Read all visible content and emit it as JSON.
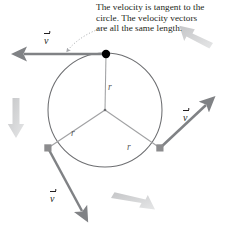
{
  "figure": {
    "caption": {
      "lines": [
        "The velocity is tangent to the",
        "circle. The velocity vectors",
        "are all the same length."
      ]
    },
    "circle": {
      "center_x": 105,
      "center_y": 110,
      "radius": 57,
      "stroke": "#6d6e71"
    },
    "radii_labels": [
      {
        "text": "r",
        "x": 108,
        "y": 83
      },
      {
        "text": "r",
        "x": 71,
        "y": 129
      },
      {
        "text": "r",
        "x": 127,
        "y": 143
      }
    ],
    "particles": [
      {
        "name": "particle-top",
        "x": 106,
        "y": 54,
        "fill": "#000000",
        "r": 4.2
      },
      {
        "name": "particle-lower-left",
        "x": 48,
        "y": 148,
        "fill": "#8c8c8e",
        "r": 3.4
      },
      {
        "name": "particle-lower-right",
        "x": 160,
        "y": 148,
        "fill": "#8c8c8e",
        "r": 3.4
      }
    ],
    "velocity_vectors": [
      {
        "name": "velocity-vector-top",
        "label": "v",
        "x1": 106,
        "y1": 54,
        "x2": 22,
        "y2": 54,
        "color": "#808285"
      },
      {
        "name": "velocity-vector-right",
        "label": "v",
        "x1": 160,
        "y1": 148,
        "x2": 208,
        "y2": 103,
        "color": "#808285"
      },
      {
        "name": "velocity-vector-lower-left",
        "label": "v",
        "x1": 48,
        "y1": 148,
        "x2": 84,
        "y2": 213,
        "color": "#808285"
      }
    ],
    "velocity_label_positions": [
      {
        "x": 44,
        "y": 36
      },
      {
        "x": 183,
        "y": 113
      },
      {
        "x": 50,
        "y": 194
      }
    ],
    "motion_arrows": [
      {
        "name": "motion-arrow-left",
        "direction": "down"
      },
      {
        "name": "motion-arrow-upper-right",
        "direction": "up-left"
      },
      {
        "name": "motion-arrow-bottom",
        "direction": "up-right"
      }
    ],
    "leader_line": {
      "name": "caption-leader-line",
      "style": "dotted-curve",
      "from_x": 106,
      "from_y": 30,
      "to_x": 66,
      "to_y": 52
    },
    "colors": {
      "text": "#231f20",
      "circle_stroke": "#6d6e71",
      "radius_stroke": "#9a9b9d",
      "vector": "#808285",
      "motion_arrow": "#c8c9cb",
      "particle_dark": "#000000",
      "particle_gray": "#8c8c8e"
    }
  }
}
